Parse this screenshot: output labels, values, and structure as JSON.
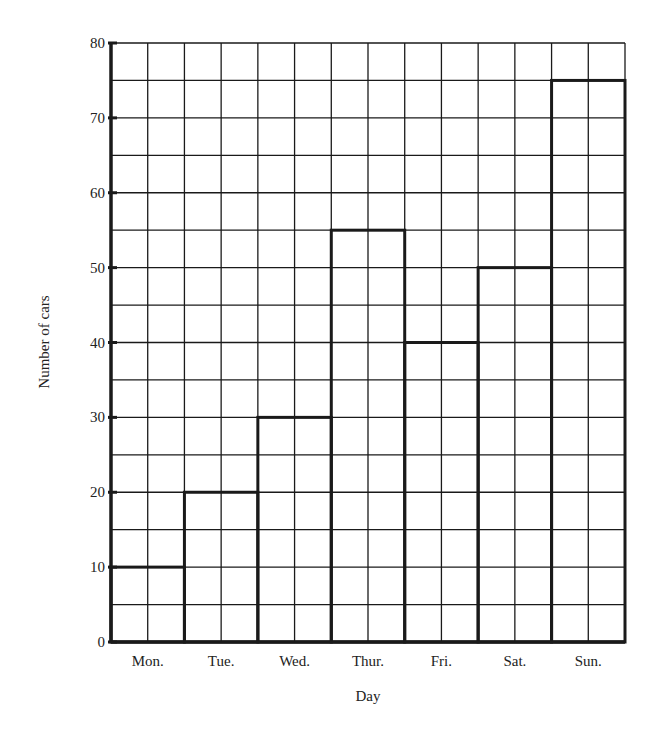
{
  "chart_data": {
    "type": "bar",
    "title": "",
    "xlabel": "Day",
    "ylabel": "Number of cars",
    "categories": [
      "Mon.",
      "Tue.",
      "Wed.",
      "Thur.",
      "Fri.",
      "Sat.",
      "Sun."
    ],
    "values": [
      10,
      20,
      30,
      55,
      40,
      50,
      75
    ],
    "ylim": [
      0,
      80
    ],
    "yticks": [
      0,
      10,
      20,
      30,
      40,
      50,
      60,
      70,
      80
    ],
    "grid": true,
    "grid_step": 5,
    "bar_style": "outline, no fill",
    "legend": null
  },
  "colors": {
    "line": "#1a1a1a",
    "background": "#ffffff"
  }
}
